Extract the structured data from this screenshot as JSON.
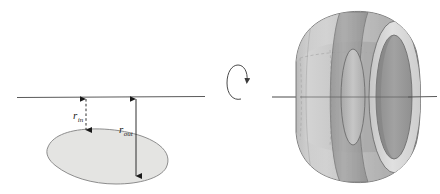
{
  "figure": {
    "background_color": "#ffffff",
    "panels": [
      {
        "name": "cross-section-panel",
        "description": "2D cross-section region below a horizontal axis of revolution with two radius dimension arrows"
      },
      {
        "name": "solid-panel",
        "description": "3D shaded solid of revolution (ring torus-like) pierced by the axis of revolution"
      }
    ],
    "labels": {
      "r_in": {
        "symbol": "r",
        "subscript": "in",
        "text": "r in"
      },
      "r_out": {
        "symbol": "r",
        "subscript": "out",
        "text": "r out"
      }
    },
    "colors": {
      "axis_line": "#555555",
      "arrow": "#1a1a1a",
      "cross_section_fill": "#e4e4e2",
      "cross_section_stroke": "#8d8d8d",
      "solid_light": "#cfcfcf",
      "solid_mid": "#b6b6b6",
      "solid_dark": "#9a9a9a",
      "solid_darker": "#8a8a8a",
      "solid_highlight": "#dedede",
      "solid_stroke": "#6e6e6e",
      "hidden_line": "#a9a9a9",
      "rotation_arrow": "#4a4a4a"
    },
    "geometry": {
      "axis_left": {
        "x1": 17,
        "y1": 97,
        "x2": 205,
        "y2": 97
      },
      "axis_right": {
        "x1": 272,
        "y1": 97,
        "x2": 437,
        "y2": 97
      },
      "r_in_arrow": {
        "x": 86,
        "y_top": 97,
        "y_bottom": 133
      },
      "r_out_arrow": {
        "x": 136,
        "y_top": 97,
        "y_bottom": 179
      },
      "rotation_marker": {
        "cx": 236,
        "cy": 88,
        "rx": 8,
        "ry": 16
      }
    }
  }
}
